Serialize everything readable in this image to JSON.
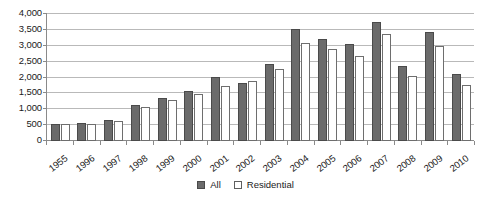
{
  "chart_data": {
    "type": "bar",
    "title": "",
    "subtitle": "",
    "xlabel": "",
    "ylabel": "",
    "ylim": [
      0,
      4000
    ],
    "ytick_step": 500,
    "ytick_labels": [
      "0",
      "500",
      "1,000",
      "1,500",
      "2,000",
      "2,500",
      "3,000",
      "3,500",
      "4,000"
    ],
    "grid": "horizontal",
    "legend_position": "bottom-center",
    "categories": [
      "1955",
      "1996",
      "1997",
      "1998",
      "1999",
      "2000",
      "2001",
      "2002",
      "2003",
      "2004",
      "2005",
      "2006",
      "2007",
      "2008",
      "2009",
      "2010"
    ],
    "series": [
      {
        "name": "All",
        "color": "#6b6b6b",
        "values": [
          550,
          560,
          660,
          1150,
          1340,
          1580,
          2020,
          1830,
          2420,
          3530,
          3210,
          3060,
          3750,
          2350,
          3430,
          2120
        ]
      },
      {
        "name": "Residential",
        "color": "#ffffff",
        "values": [
          545,
          535,
          630,
          1070,
          1280,
          1470,
          1720,
          1880,
          2260,
          3100,
          2900,
          2670,
          3370,
          2050,
          3000,
          1760
        ]
      }
    ]
  },
  "legend": {
    "items": [
      {
        "label": "All",
        "swatch": "filled-gray-square-icon"
      },
      {
        "label": "Residential",
        "swatch": "outlined-white-square-icon"
      }
    ]
  },
  "colors": {
    "all_fill": "#6b6b6b",
    "all_border": "#4a4a4a",
    "residential_fill": "#ffffff",
    "residential_border": "#6e6e6e",
    "gridline": "#b9b9b9",
    "axis": "#8a8a8a",
    "text": "#1a1a1a",
    "background": "#ffffff"
  }
}
